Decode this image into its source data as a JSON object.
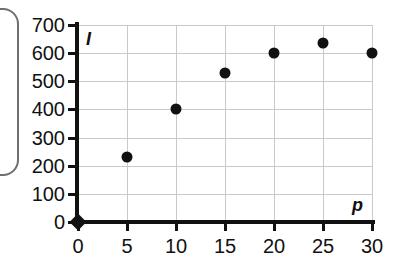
{
  "chart_data": {
    "type": "scatter",
    "title": "",
    "xlabel": "p",
    "ylabel": "I",
    "xlim": [
      0,
      30
    ],
    "ylim": [
      0,
      700
    ],
    "grid": true,
    "legend": "none",
    "x": [
      0,
      5,
      10,
      15,
      20,
      25,
      30
    ],
    "values": [
      0,
      230,
      400,
      530,
      600,
      635,
      600
    ],
    "points": [
      {
        "x": 0,
        "y": 0
      },
      {
        "x": 5,
        "y": 230
      },
      {
        "x": 10,
        "y": 400
      },
      {
        "x": 15,
        "y": 530
      },
      {
        "x": 20,
        "y": 600
      },
      {
        "x": 25,
        "y": 635
      },
      {
        "x": 30,
        "y": 600
      }
    ],
    "xticks": [
      "0",
      "5",
      "10",
      "15",
      "20",
      "25",
      "30"
    ],
    "yticks": [
      "0",
      "100",
      "200",
      "300",
      "400",
      "500",
      "600",
      "700"
    ]
  }
}
